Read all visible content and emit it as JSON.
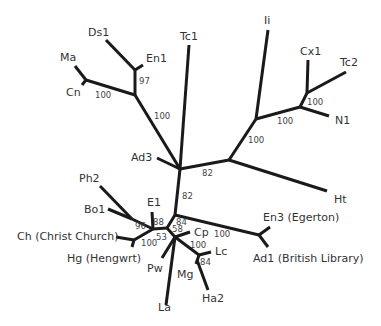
{
  "diagram": {
    "type": "unrooted phylogenetic tree",
    "line_color": "#1a1a1a",
    "text_color": "#333333",
    "leaves": [
      {
        "id": "Ds1",
        "label": "Ds1"
      },
      {
        "id": "En1",
        "label": "En1"
      },
      {
        "id": "Ma",
        "label": "Ma"
      },
      {
        "id": "Cn",
        "label": "Cn"
      },
      {
        "id": "Tc1",
        "label": "Tc1"
      },
      {
        "id": "Ii",
        "label": "Ii"
      },
      {
        "id": "Cx1",
        "label": "Cx1"
      },
      {
        "id": "Tc2",
        "label": "Tc2"
      },
      {
        "id": "N1",
        "label": "N1"
      },
      {
        "id": "Ad3",
        "label": "Ad3"
      },
      {
        "id": "Ht",
        "label": "Ht"
      },
      {
        "id": "Ph2",
        "label": "Ph2"
      },
      {
        "id": "E1",
        "label": "E1"
      },
      {
        "id": "Bo1",
        "label": "Bo1"
      },
      {
        "id": "Ch",
        "label": "Ch (Christ Church)"
      },
      {
        "id": "Hg",
        "label": "Hg (Hengwrt)"
      },
      {
        "id": "En3",
        "label": "En3 (Egerton)"
      },
      {
        "id": "Ad1",
        "label": "Ad1 (British Library)"
      },
      {
        "id": "Cp",
        "label": "Cp"
      },
      {
        "id": "Lc",
        "label": "Lc"
      },
      {
        "id": "Pw",
        "label": "Pw"
      },
      {
        "id": "Mg",
        "label": "Mg"
      },
      {
        "id": "La",
        "label": "La"
      },
      {
        "id": "Ha2",
        "label": "Ha2"
      }
    ],
    "support_values": [
      {
        "clade": "Ds1+En1",
        "value": "97"
      },
      {
        "clade": "Ma+Cn",
        "value": "100"
      },
      {
        "clade": "Ds1+En1+Ma+Cn",
        "value": "100"
      },
      {
        "clade": "Ii+Cx1+Tc2+N1+Ht",
        "value": "82"
      },
      {
        "clade": "Ii+Cx1+Tc2+N1",
        "value": "100"
      },
      {
        "clade": "Cx1+Tc2+N1",
        "value": "100"
      },
      {
        "clade": "Cx1+Tc2",
        "value": "100"
      },
      {
        "clade": "lower group",
        "value": "82"
      },
      {
        "clade": "En3+Ad1",
        "value": "100"
      },
      {
        "clade": "inner-a",
        "value": "84"
      },
      {
        "clade": "inner-b",
        "value": "58"
      },
      {
        "clade": "E1 group",
        "value": "88"
      },
      {
        "clade": "Ph2+Bo1",
        "value": "96"
      },
      {
        "clade": "E1 group inner",
        "value": "53"
      },
      {
        "clade": "Ch+Hg",
        "value": "100"
      },
      {
        "clade": "Lc+Mg+Ha2",
        "value": "100"
      },
      {
        "clade": "Mg+Ha2",
        "value": "84"
      }
    ]
  }
}
